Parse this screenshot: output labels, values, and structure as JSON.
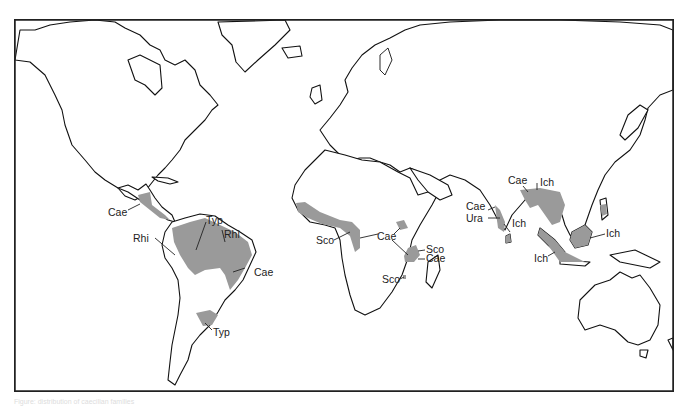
{
  "map": {
    "type": "world-distribution-map",
    "colors": {
      "range_fill": "#9a9a9a",
      "coastline": "#111111",
      "background": "#ffffff",
      "frame": "#222222"
    },
    "labels": [
      {
        "id": "ca-cae",
        "text": "Cae",
        "region": "Central America"
      },
      {
        "id": "sa-rhi-w",
        "text": "Rhi",
        "region": "Western Amazon"
      },
      {
        "id": "sa-typ-n",
        "text": "Typ",
        "region": "Amazon"
      },
      {
        "id": "sa-rhi-e",
        "text": "Rhi",
        "region": "Guianas"
      },
      {
        "id": "sa-cae",
        "text": "Cae",
        "region": "Eastern Brazil"
      },
      {
        "id": "sa-typ-s",
        "text": "Typ",
        "region": "Southern Brazil / Uruguay"
      },
      {
        "id": "af-sco-w",
        "text": "Sco",
        "region": "West Africa"
      },
      {
        "id": "af-cae",
        "text": "Cae",
        "region": "Central/East Africa"
      },
      {
        "id": "af-sco-e",
        "text": "Sco",
        "region": "East Africa coast"
      },
      {
        "id": "af-cae-e",
        "text": "Cae",
        "region": "East Africa coast"
      },
      {
        "id": "af-sco-s",
        "text": "Sco",
        "region": "Malawi"
      },
      {
        "id": "in-cae",
        "text": "Cae",
        "region": "Western India"
      },
      {
        "id": "in-ura",
        "text": "Ura",
        "region": "Southern India"
      },
      {
        "id": "in-ich",
        "text": "Ich",
        "region": "Sri Lanka"
      },
      {
        "id": "as-cae",
        "text": "Cae",
        "region": "Northeast India"
      },
      {
        "id": "as-ich",
        "text": "Ich",
        "region": "Southeast Asia"
      },
      {
        "id": "bo-ich",
        "text": "Ich",
        "region": "Borneo / Philippines"
      },
      {
        "id": "su-ich",
        "text": "Ich",
        "region": "Sumatra / Java"
      }
    ]
  },
  "caption": "Figure: distribution of caecilian families"
}
